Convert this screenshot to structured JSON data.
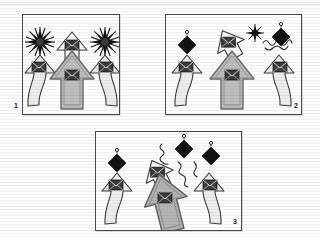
{
  "figure": {
    "background_color": "#ffffff",
    "width": 320,
    "height": 237,
    "panel_border_color": "#4a4a4a"
  },
  "palette": {
    "arrow_light": "#e4e4e4",
    "arrow_mid": "#bdbdbd",
    "arrow_dark": "#a8a8a8",
    "icon_dark": "#3b3b3b",
    "outline": "#3a3a3a",
    "black": "#111111",
    "white": "#ffffff"
  },
  "panels": [
    {
      "id": "panel-1",
      "label": "1",
      "x": 22,
      "y": 14,
      "w": 96,
      "h": 99,
      "label_x": 14,
      "label_y": 104,
      "description": "Three upward arrows with envelope icons; two black starbursts flank a small arrow at top",
      "elements": [
        {
          "kind": "starburst",
          "name": "starburst-left",
          "cx": 39,
          "cy": 41,
          "r": 12,
          "color": "#111111"
        },
        {
          "kind": "starburst",
          "name": "starburst-right",
          "cx": 104,
          "cy": 41,
          "r": 12,
          "color": "#111111"
        },
        {
          "kind": "arrow-small",
          "name": "arrow-top-center",
          "cx": 71,
          "cy": 45,
          "scale": 1.0,
          "fill": "#ffffff",
          "rotation": 0
        },
        {
          "kind": "arrow-wavy",
          "name": "arrow-left-wavy",
          "cx": 39,
          "cy": 82,
          "fill": "#eeeeee",
          "flip": false
        },
        {
          "kind": "arrow-wavy",
          "name": "arrow-right-wavy",
          "cx": 104,
          "cy": 82,
          "fill": "#eeeeee",
          "flip": true
        },
        {
          "kind": "arrow-big",
          "name": "arrow-center-big",
          "cx": 71,
          "cy": 86,
          "fill": "#bdbdbd"
        }
      ]
    },
    {
      "id": "panel-2",
      "label": "2",
      "x": 165,
      "y": 14,
      "w": 135,
      "h": 99,
      "label_x": 294,
      "label_y": 104,
      "description": "Same three arrows; starbursts replaced by black diamonds, one arrow tilted, squiggle trail at right",
      "elements": [
        {
          "kind": "diamond",
          "name": "diamond-left",
          "cx": 186,
          "cy": 44,
          "r": 8,
          "color": "#111111"
        },
        {
          "kind": "arrow-tilted",
          "name": "arrow-top-tilted",
          "cx": 228,
          "cy": 42,
          "rotation": -28,
          "fill": "#ffffff"
        },
        {
          "kind": "starburst",
          "name": "starburst-small",
          "cx": 254,
          "cy": 32,
          "r": 7,
          "color": "#111111"
        },
        {
          "kind": "squiggle",
          "name": "squiggle-trail-right",
          "x1": 262,
          "y1": 42,
          "x2": 286,
          "y2": 36
        },
        {
          "kind": "diamond",
          "name": "diamond-right",
          "cx": 280,
          "cy": 36,
          "r": 9,
          "color": "#111111"
        },
        {
          "kind": "arrow-wavy",
          "name": "arrow-left-wavy",
          "cx": 186,
          "cy": 82,
          "fill": "#eeeeee",
          "flip": false
        },
        {
          "kind": "arrow-wavy",
          "name": "arrow-right-wavy",
          "cx": 278,
          "cy": 82,
          "fill": "#eeeeee",
          "flip": true
        },
        {
          "kind": "arrow-big",
          "name": "arrow-center-big",
          "cx": 231,
          "cy": 86,
          "fill": "#bdbdbd"
        }
      ]
    },
    {
      "id": "panel-3",
      "label": "3",
      "x": 95,
      "y": 131,
      "w": 145,
      "h": 98,
      "label_x": 233,
      "label_y": 220,
      "description": "Three diamonds with squiggle trails above arrows; center arrow tilted and large",
      "elements": [
        {
          "kind": "diamond",
          "name": "diamond-left",
          "cx": 116,
          "cy": 162,
          "r": 9,
          "color": "#111111"
        },
        {
          "kind": "diamond",
          "name": "diamond-center",
          "cx": 183,
          "cy": 148,
          "r": 9,
          "color": "#111111"
        },
        {
          "kind": "diamond",
          "name": "diamond-right",
          "cx": 210,
          "cy": 155,
          "r": 9,
          "color": "#111111"
        },
        {
          "kind": "squiggle",
          "name": "squiggle-center",
          "x1": 162,
          "y1": 142,
          "x2": 176,
          "y2": 158
        },
        {
          "kind": "squiggle",
          "name": "squiggle-right",
          "x1": 180,
          "y1": 162,
          "x2": 205,
          "y2": 172
        },
        {
          "kind": "arrow-tilted",
          "name": "arrow-top-tilted",
          "cx": 157,
          "cy": 172,
          "rotation": -26,
          "fill": "#ffffff"
        },
        {
          "kind": "arrow-wavy",
          "name": "arrow-left-wavy",
          "cx": 116,
          "cy": 196,
          "fill": "#eeeeee",
          "flip": false
        },
        {
          "kind": "arrow-wavy",
          "name": "arrow-right-wavy",
          "cx": 208,
          "cy": 196,
          "fill": "#eeeeee",
          "flip": true
        },
        {
          "kind": "arrow-big-tilted",
          "name": "arrow-center-big-tilted",
          "cx": 163,
          "cy": 198,
          "rotation": -14,
          "fill": "#bdbdbd"
        }
      ]
    }
  ]
}
